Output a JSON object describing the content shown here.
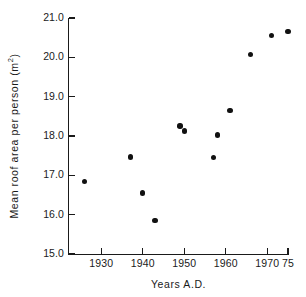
{
  "chart_data": {
    "type": "scatter",
    "title": "",
    "xlabel": "Years A.D.",
    "ylabel": "Mean roof area per person  (m2)",
    "ylabel_prefix": "Mean roof area per person  (m",
    "ylabel_sup": "2",
    "ylabel_suffix": ")",
    "xlim": [
      1922,
      1975
    ],
    "ylim": [
      15.0,
      21.0
    ],
    "grid": false,
    "legend": "none",
    "marker": "filled-circle",
    "marker_color": "#111111",
    "axis_color": "#1a1a1a",
    "background_color": "#ffffff",
    "xticks": [
      {
        "value": 1930,
        "label": "1930"
      },
      {
        "value": 1940,
        "label": "1940"
      },
      {
        "value": 1950,
        "label": "1950"
      },
      {
        "value": 1960,
        "label": "1960"
      },
      {
        "value": 1970,
        "label": "1970"
      },
      {
        "value": 1975,
        "label": "75"
      }
    ],
    "yticks": [
      {
        "value": 15.0,
        "label": "15.0"
      },
      {
        "value": 16.0,
        "label": "16.0"
      },
      {
        "value": 17.0,
        "label": "17.0"
      },
      {
        "value": 18.0,
        "label": "18.0"
      },
      {
        "value": 19.0,
        "label": "19.0"
      },
      {
        "value": 20.0,
        "label": "20.0"
      },
      {
        "value": 21.0,
        "label": "21.0"
      }
    ],
    "x": [
      1926,
      1937,
      1940,
      1943,
      1949,
      1950,
      1957,
      1958,
      1961,
      1966,
      1971,
      1975
    ],
    "y": [
      16.85,
      17.47,
      16.55,
      15.85,
      18.25,
      18.13,
      17.45,
      18.03,
      18.65,
      20.07,
      20.55,
      20.65
    ],
    "points": [
      {
        "x": 1926,
        "y": 16.85
      },
      {
        "x": 1937,
        "y": 17.47
      },
      {
        "x": 1940,
        "y": 16.55
      },
      {
        "x": 1943,
        "y": 15.85
      },
      {
        "x": 1949,
        "y": 18.25
      },
      {
        "x": 1950,
        "y": 18.13
      },
      {
        "x": 1957,
        "y": 17.45
      },
      {
        "x": 1958,
        "y": 18.03
      },
      {
        "x": 1961,
        "y": 18.65
      },
      {
        "x": 1966,
        "y": 20.07
      },
      {
        "x": 1971,
        "y": 20.55
      },
      {
        "x": 1975,
        "y": 20.65
      }
    ]
  }
}
